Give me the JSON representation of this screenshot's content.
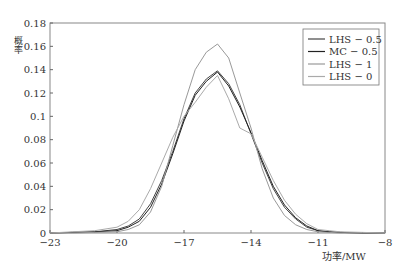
{
  "chart_data": {
    "type": "line",
    "title": "",
    "xlabel": "功率/MW",
    "ylabel": "概率",
    "xlim": [
      -23,
      -8
    ],
    "ylim": [
      0,
      0.18
    ],
    "xticks": [
      -23,
      -20,
      -17,
      -14,
      -11,
      -8
    ],
    "yticks": [
      0,
      0.02,
      0.04,
      0.06,
      0.08,
      0.1,
      0.12,
      0.14,
      0.16,
      0.18
    ],
    "ytick_labels": [
      "0",
      "0.02",
      "0.04",
      "0.06",
      "0.08",
      "0.1",
      "0.12",
      "0.14",
      "0.16",
      "0.18"
    ],
    "grid": false,
    "legend_position": "upper right",
    "x": [
      -23,
      -22,
      -21,
      -20,
      -19.5,
      -19,
      -18.5,
      -18,
      -17.5,
      -17,
      -16.5,
      -16,
      -15.5,
      -15,
      -14.5,
      -14,
      -13.5,
      -13,
      -12.5,
      -12,
      -11.5,
      -11,
      -10.5,
      -10,
      -9,
      -8
    ],
    "series": [
      {
        "name": "LHS-0.5",
        "color": "#444444",
        "values": [
          0,
          0.0005,
          0.001,
          0.003,
          0.006,
          0.012,
          0.025,
          0.045,
          0.07,
          0.098,
          0.12,
          0.132,
          0.139,
          0.128,
          0.11,
          0.085,
          0.06,
          0.038,
          0.022,
          0.012,
          0.005,
          0.002,
          0.001,
          0.0005,
          0,
          0
        ]
      },
      {
        "name": "MC-0.5",
        "color": "#222222",
        "values": [
          0,
          0.0005,
          0.001,
          0.002,
          0.005,
          0.01,
          0.022,
          0.042,
          0.068,
          0.096,
          0.118,
          0.13,
          0.138,
          0.126,
          0.108,
          0.086,
          0.062,
          0.04,
          0.024,
          0.013,
          0.006,
          0.002,
          0.001,
          0.0005,
          0,
          0
        ]
      },
      {
        "name": "LHS-1",
        "color": "#999999",
        "values": [
          0,
          0,
          0.0005,
          0.001,
          0.003,
          0.007,
          0.018,
          0.04,
          0.075,
          0.11,
          0.14,
          0.155,
          0.162,
          0.15,
          0.12,
          0.09,
          0.055,
          0.03,
          0.015,
          0.007,
          0.003,
          0.001,
          0.0005,
          0,
          0,
          0
        ]
      },
      {
        "name": "LHS-0",
        "color": "#aaaaaa",
        "values": [
          0,
          0.001,
          0.002,
          0.005,
          0.01,
          0.02,
          0.038,
          0.06,
          0.082,
          0.1,
          0.112,
          0.125,
          0.135,
          0.115,
          0.09,
          0.085,
          0.065,
          0.045,
          0.028,
          0.016,
          0.008,
          0.003,
          0.002,
          0.001,
          0.0005,
          0
        ]
      }
    ]
  }
}
